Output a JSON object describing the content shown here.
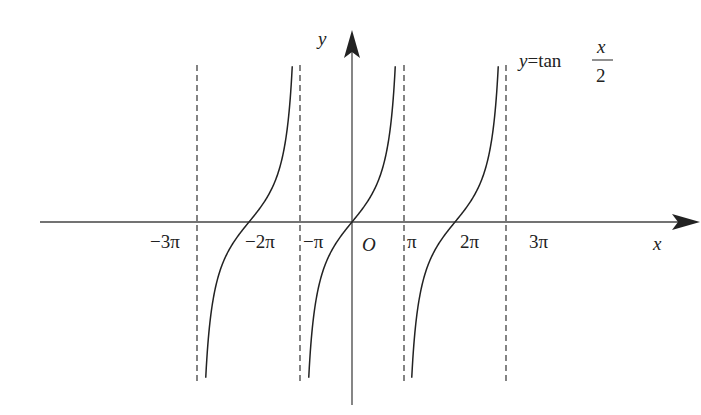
{
  "chart_data": {
    "type": "line",
    "function": "tan(x/2)",
    "xlabel": "x",
    "ylabel": "y",
    "origin_label": "O",
    "x_tick_labels": [
      "−3π",
      "−2π",
      "−π",
      "π",
      "2π",
      "3π"
    ],
    "x_tick_values": [
      -9.4248,
      -6.2832,
      -3.1416,
      3.1416,
      6.2832,
      9.4248
    ],
    "asymptotes": [
      -9.4248,
      -3.1416,
      3.1416,
      9.4248
    ],
    "branches": [
      {
        "domain": [
          -9.4248,
          -3.1416
        ],
        "zero": -6.2832
      },
      {
        "domain": [
          -3.1416,
          3.1416
        ],
        "zero": 0
      },
      {
        "domain": [
          3.1416,
          9.4248
        ],
        "zero": 6.2832
      }
    ],
    "grid": false,
    "legend": null,
    "annotation": {
      "prefix": "y=tan",
      "numerator": "x",
      "denominator": "2"
    }
  }
}
